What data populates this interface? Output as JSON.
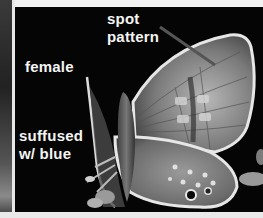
{
  "figure": {
    "labels": {
      "spot_line1": "spot",
      "spot_line2": "pattern",
      "female": "female",
      "suffused_line1": "suffused",
      "suffused_line2": "w/ blue"
    }
  }
}
